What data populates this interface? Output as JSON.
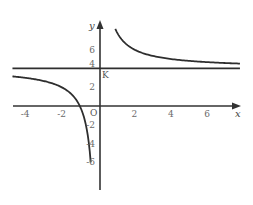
{
  "chart_data": {
    "type": "line",
    "title": "",
    "xlabel": "x",
    "ylabel": "y",
    "origin_label": "O",
    "point_label": "K",
    "point_label_coord": [
      0,
      4
    ],
    "function": "y = 4 + 4/x",
    "xlim": [
      -4.7,
      7.8
    ],
    "ylim": [
      -9,
      9
    ],
    "grid": false,
    "legend": null,
    "x_ticks": [
      {
        "value": -4,
        "label": "-4"
      },
      {
        "value": -2,
        "label": "-2"
      },
      {
        "value": 2,
        "label": "2"
      },
      {
        "value": 4,
        "label": "4"
      },
      {
        "value": 6,
        "label": "6"
      }
    ],
    "y_ticks": [
      {
        "value": 6,
        "label": "6"
      },
      {
        "value": 4,
        "label": "4"
      },
      {
        "value": 2,
        "label": "2"
      },
      {
        "value": -2,
        "label": "-2"
      },
      {
        "value": -4,
        "label": "-4"
      },
      {
        "value": -6,
        "label": "-6"
      }
    ],
    "series": [
      {
        "name": "left-branch",
        "x": [
          -4.7,
          -4,
          -3,
          -2.5,
          -2,
          -1.5,
          -1.2,
          -1,
          -0.8,
          -0.6,
          -0.5,
          -0.45,
          -0.4
        ],
        "y": [
          3.15,
          3.0,
          2.67,
          2.4,
          2.0,
          1.33,
          0.67,
          0.0,
          -1.0,
          -2.67,
          -4.0,
          -4.89,
          -6.0
        ]
      },
      {
        "name": "right-branch",
        "x": [
          0.95,
          1,
          1.2,
          1.5,
          2,
          2.5,
          3,
          4,
          5,
          6,
          7,
          7.8
        ],
        "y": [
          8.21,
          8.0,
          7.33,
          6.67,
          6.0,
          5.6,
          5.33,
          5.0,
          4.8,
          4.67,
          4.57,
          4.51
        ]
      },
      {
        "name": "horizontal-asymptote",
        "x": [
          -4.7,
          7.8
        ],
        "y": [
          4,
          4
        ]
      }
    ]
  }
}
